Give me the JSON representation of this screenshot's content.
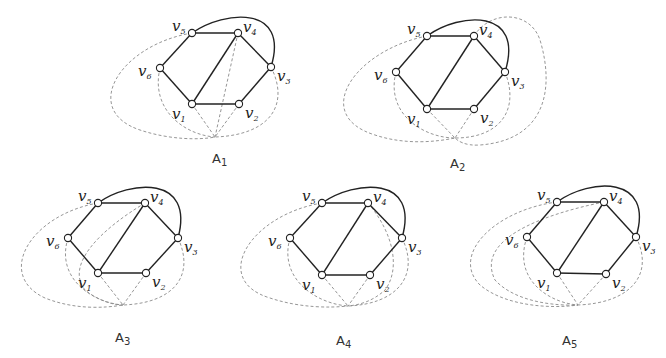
{
  "figure": {
    "panels": [
      {
        "id": "A1",
        "caption_base": "A",
        "caption_sub": "1",
        "caption_pos": [
          212,
          163
        ],
        "vertices": {
          "v1": [
            192,
            104
          ],
          "v2": [
            239,
            104
          ],
          "v3": [
            271,
            67
          ],
          "v4": [
            238,
            33
          ],
          "v5": [
            192,
            33
          ],
          "v6": [
            160,
            68
          ]
        },
        "conv": [
          215,
          137
        ],
        "arc": "M192 33 C 225 10, 290 5, 271 67",
        "dashed": [
          "M192 104 L215 137",
          "M239 104 L215 137",
          "M238 33 L215 137",
          "M160 68 C 150 110, 185 135, 215 137",
          "M271 67 C 290 105, 270 135, 215 137",
          "M192 33 C 120 45, 80 110, 140 130 C 170 140, 200 140, 215 137"
        ]
      },
      {
        "id": "A2",
        "caption_base": "A",
        "caption_sub": "2",
        "caption_pos": [
          450,
          168
        ],
        "vertices": {
          "v1": [
            427,
            109
          ],
          "v2": [
            474,
            109
          ],
          "v3": [
            505,
            72
          ],
          "v4": [
            474,
            36
          ],
          "v5": [
            427,
            36
          ],
          "v6": [
            396,
            72
          ]
        },
        "conv": [
          455,
          138
        ],
        "arc": "M427 36 C 460 12, 525 8, 505 72",
        "dashed": [
          "M427 109 L455 138",
          "M474 109 L455 138",
          "M396 72 C 385 115, 425 138, 455 138",
          "M505 72 C 520 110, 500 138, 455 138",
          "M427 36 C 355 50, 310 115, 375 135 C 405 145, 435 142, 455 138",
          "M474 36 C 490 10, 530 10, 540 40 C 555 90, 545 140, 480 145 C 465 146, 458 141, 455 138"
        ]
      },
      {
        "id": "A3",
        "caption_base": "A",
        "caption_sub": "3",
        "caption_pos": [
          115,
          342
        ],
        "vertices": {
          "v1": [
            98,
            273
          ],
          "v2": [
            146,
            273
          ],
          "v3": [
            178,
            238
          ],
          "v4": [
            145,
            203
          ],
          "v5": [
            98,
            203
          ],
          "v6": [
            68,
            238
          ]
        },
        "conv": [
          123,
          305
        ],
        "arc": "M98 203 C 130 180, 195 175, 178 238",
        "dashed": [
          "M98 273 L123 305",
          "M146 273 L123 305",
          "M68 238 C 55 280, 95 303, 123 305",
          "M178 238 C 195 275, 175 303, 123 305",
          "M145 203 C 100 230, 65 265, 85 290 C 100 302, 115 305, 123 305",
          "M98 203 C 30 215, -5 275, 45 298 C 75 310, 105 308, 123 305"
        ]
      },
      {
        "id": "A4",
        "caption_base": "A",
        "caption_sub": "4",
        "caption_pos": [
          336,
          345
        ],
        "vertices": {
          "v1": [
            322,
            275
          ],
          "v2": [
            370,
            275
          ],
          "v3": [
            402,
            238
          ],
          "v4": [
            368,
            203
          ],
          "v5": [
            322,
            203
          ],
          "v6": [
            290,
            238
          ]
        },
        "conv": [
          348,
          306
        ],
        "arc": "M322 203 C 355 180, 420 175, 402 238",
        "dashed": [
          "M322 275 L348 306",
          "M370 275 L348 306",
          "M290 238 C 278 280, 318 304, 348 306",
          "M402 238 C 420 275, 398 304, 348 306",
          "M368 203 C 395 235, 400 270, 385 290 C 372 302, 358 305, 348 306",
          "M322 203 C 250 215, 210 280, 270 298 C 300 308, 330 308, 348 306"
        ]
      },
      {
        "id": "A5",
        "caption_base": "A",
        "caption_sub": "5",
        "caption_pos": [
          562,
          345
        ],
        "vertices": {
          "v1": [
            557,
            273
          ],
          "v2": [
            606,
            274
          ],
          "v3": [
            636,
            237
          ],
          "v4": [
            604,
            202
          ],
          "v5": [
            557,
            202
          ],
          "v6": [
            527,
            237
          ]
        },
        "conv": [
          578,
          305
        ],
        "arc": "M557 202 C 590 178, 655 175, 636 237",
        "dashed": [
          "M557 273 L578 305",
          "M606 274 L578 305",
          "M527 237 C 512 280, 550 303, 578 305",
          "M636 237 C 655 275, 630 303, 578 305",
          "M604 202 C 540 215, 475 240, 495 280 C 515 302, 555 306, 578 305",
          "M557 202 C 495 210, 450 255, 480 285 C 505 306, 550 309, 578 305"
        ]
      }
    ],
    "labels": {
      "v1": {
        "base": "v",
        "sub": "1"
      },
      "v2": {
        "base": "v",
        "sub": "2"
      },
      "v3": {
        "base": "v",
        "sub": "3"
      },
      "v4": {
        "base": "v",
        "sub": "4"
      },
      "v5": {
        "base": "v",
        "sub": "5"
      },
      "v6": {
        "base": "v",
        "sub": "6"
      }
    },
    "label_offsets": {
      "v1": [
        -20,
        15
      ],
      "v2": [
        6,
        14
      ],
      "v3": [
        6,
        14
      ],
      "v4": [
        5,
        -1
      ],
      "v5": [
        -20,
        -2
      ],
      "v6": [
        -22,
        8
      ]
    },
    "solid_edges": [
      [
        "v1",
        "v2"
      ],
      [
        "v2",
        "v3"
      ],
      [
        "v3",
        "v4"
      ],
      [
        "v4",
        "v5"
      ],
      [
        "v5",
        "v6"
      ],
      [
        "v6",
        "v1"
      ],
      [
        "v1",
        "v4"
      ]
    ]
  }
}
